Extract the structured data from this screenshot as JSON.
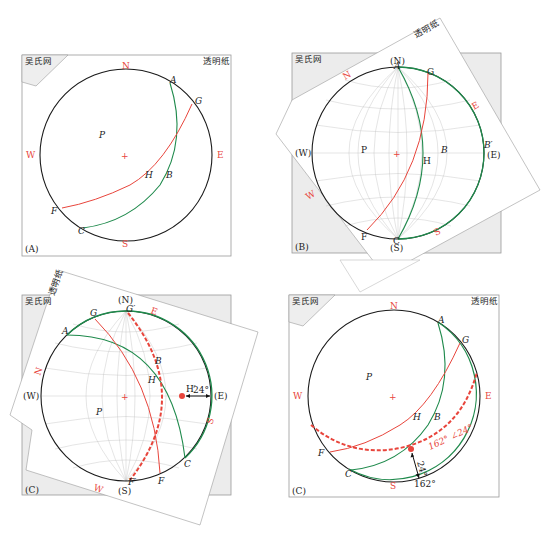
{
  "colors": {
    "primitive_circle": "#1a1a1a",
    "red_plane": "#e8453c",
    "green_plane": "#1f8a4c",
    "grid": "#bdbdbd",
    "frame": "#9a9a9a",
    "underlay": "#ececec"
  },
  "common": {
    "net_label": "吴氏网",
    "tracing_paper_label": "透明纸",
    "center_mark": "+"
  },
  "panel_a": {
    "tag": "(A)",
    "dir": {
      "n": "N",
      "s": "S",
      "w": "W",
      "e": "E"
    },
    "points": {
      "a": "A",
      "g": "G",
      "p": "P",
      "h": "H",
      "b": "B",
      "f": "F",
      "c": "C"
    }
  },
  "panel_b": {
    "tag": "(B)",
    "net_dir": {
      "n": "(N)",
      "s": "(S)",
      "w": "(W)",
      "e": "(E)"
    },
    "paper_dir": {
      "n": "N",
      "s": "S",
      "w": "W",
      "e": "E"
    },
    "points": {
      "a": "A",
      "g": "G",
      "p": "P",
      "h": "H",
      "b": "B",
      "b_prime": "B′",
      "f": "F",
      "c": "C"
    }
  },
  "panel_c1": {
    "tag": "(C)",
    "net_dir": {
      "n": "(N)",
      "s": "(S)",
      "w": "(W)",
      "e": "(E)"
    },
    "paper_dir": {
      "n": "N",
      "s": "S",
      "w": "W",
      "e": "E"
    },
    "points": {
      "a": "A",
      "g": "G",
      "g_prime": "G′",
      "p": "P",
      "h": "H",
      "h_prime": "H′",
      "b": "B",
      "f": "F",
      "f_prime": "F′",
      "c": "C"
    },
    "angle_label": "24°"
  },
  "panel_c2": {
    "tag": "(C)",
    "dir": {
      "n": "N",
      "s": "S",
      "w": "W",
      "e": "E"
    },
    "points": {
      "a": "A",
      "g": "G",
      "p": "P",
      "h": "H",
      "b": "B",
      "f": "F",
      "c": "C"
    },
    "plunge_label": "24°",
    "trend_label": "162°",
    "attitude_label": "162° ∠24°"
  }
}
